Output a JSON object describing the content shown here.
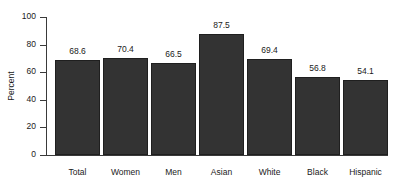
{
  "chart_data": {
    "type": "bar",
    "title": "",
    "subtitle": "",
    "xlabel": "",
    "ylabel": "Percent",
    "categories": [
      "Total",
      "Women",
      "Men",
      "Asian",
      "White",
      "Black",
      "Hispanic"
    ],
    "values": [
      68.6,
      70.4,
      66.5,
      87.5,
      69.4,
      56.8,
      54.1
    ],
    "value_labels": [
      "68.6",
      "70.4",
      "66.5",
      "87.5",
      "69.4",
      "56.8",
      "54.1"
    ],
    "ylim": [
      0,
      100
    ],
    "yticks": [
      0,
      20,
      40,
      60,
      80,
      100
    ],
    "ytick_labels": [
      "0",
      "20",
      "40",
      "60",
      "80",
      "100"
    ],
    "grid": false,
    "legend": null,
    "legend_position": "none",
    "bar_color": "#333333",
    "bar_edge_color": "#1f1f1f",
    "axis_color": "#3a3a3a",
    "background_color": "#ffffff"
  }
}
